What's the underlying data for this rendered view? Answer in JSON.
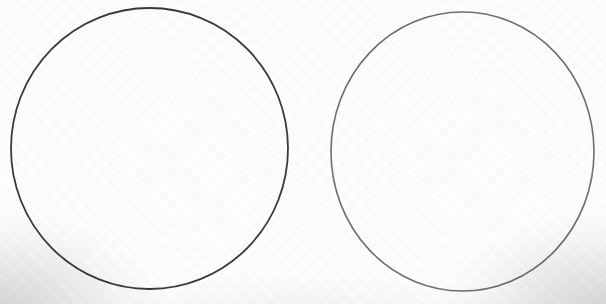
{
  "canvas": {
    "width": 606,
    "height": 304,
    "background_color": "#ffffff",
    "texture": "diagonal-weave",
    "vignette_color": "#6e7078"
  },
  "shapes": [
    {
      "name": "left-circle",
      "type": "circle",
      "cx": 149.5,
      "cy": 148.5,
      "rx": 138.5,
      "ry": 140.5,
      "stroke_color": "#3a3a3c",
      "stroke_width": 1.8,
      "fill": "none"
    },
    {
      "name": "right-circle",
      "type": "circle",
      "cx": 462.5,
      "cy": 151.5,
      "rx": 131.5,
      "ry": 139.5,
      "stroke_color": "#6f7074",
      "stroke_width": 1.6,
      "fill": "none"
    }
  ]
}
